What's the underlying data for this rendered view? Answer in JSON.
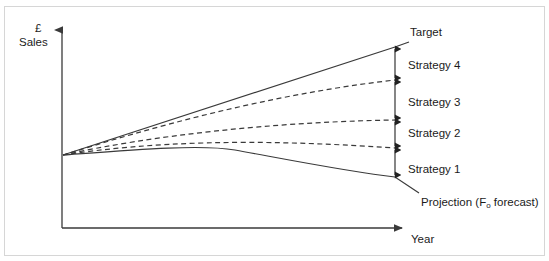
{
  "figure": {
    "type": "diagram",
    "subtype": "strategy-gap-analysis",
    "background_color": "#ffffff",
    "line_color": "#3a3a3a",
    "text_color": "#1b1b1b",
    "border_color": "#d6d6d6"
  },
  "axes": {
    "y_label_line1": "£",
    "y_label_line2": "Sales",
    "x_label": "Year",
    "y_axis_name": "sales-axis",
    "x_axis_name": "year-axis"
  },
  "curves": [
    {
      "id": "target",
      "label": "Target",
      "style": "solid",
      "shape": "straight-rising",
      "end_y_value": 47
    },
    {
      "id": "strategy4",
      "label": "Strategy 4",
      "style": "dashed",
      "shape": "rising-flattening",
      "end_y_value": 80
    },
    {
      "id": "strategy3",
      "label": "Strategy 3",
      "style": "dashed",
      "shape": "rising-flattening",
      "end_y_value": 120
    },
    {
      "id": "strategy2",
      "label": "Strategy 2",
      "style": "dashed",
      "shape": "rising-flattening",
      "end_y_value": 148
    },
    {
      "id": "strategy1",
      "label": "Strategy 1",
      "style": "solid",
      "shape": "rising-then-declining",
      "end_y_value": 177
    }
  ],
  "projection": {
    "label": "Projection (F",
    "label_subscript": "o",
    "label_tail": " forecast)"
  },
  "gap_arrows": [
    {
      "id": "gap-target-s4",
      "from": 47,
      "to": 80,
      "measures": "Strategy 4 contribution"
    },
    {
      "id": "gap-s4-s3",
      "from": 80,
      "to": 120,
      "measures": "Strategy 3 contribution"
    },
    {
      "id": "gap-s3-s2",
      "from": 120,
      "to": 148,
      "measures": "Strategy 2 contribution"
    },
    {
      "id": "gap-s2-s1",
      "from": 148,
      "to": 177,
      "measures": "Strategy 1 contribution"
    }
  ]
}
